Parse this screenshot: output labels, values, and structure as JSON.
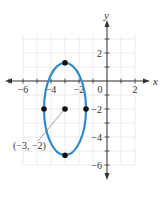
{
  "chart_data": {
    "type": "scatter",
    "title": "",
    "xlabel": "x",
    "ylabel": "y",
    "xlim": [
      -7,
      3
    ],
    "ylim": [
      -7,
      4
    ],
    "grid": true,
    "x_ticks": [
      -6,
      -4,
      -2,
      0,
      2
    ],
    "y_ticks": [
      2,
      -2,
      -4,
      -6
    ],
    "x_tick_labels": [
      "−6",
      "−4",
      "−2",
      "0",
      "2"
    ],
    "y_tick_labels": [
      "2",
      "−2",
      "−4",
      "−6"
    ],
    "curve": {
      "kind": "ellipse",
      "center": [
        -3,
        -2
      ],
      "semi_axis_x": 1.5,
      "semi_axis_y": 3.3,
      "color": "#2e8bc9"
    },
    "points": [
      {
        "x": -3,
        "y": 1.3
      },
      {
        "x": -4.5,
        "y": -2
      },
      {
        "x": -3,
        "y": -2
      },
      {
        "x": -1.5,
        "y": -2
      },
      {
        "x": -3,
        "y": -5.3
      }
    ],
    "annotations": [
      {
        "text": "(−3, −2)",
        "points_to": [
          -3,
          -2
        ]
      }
    ]
  }
}
